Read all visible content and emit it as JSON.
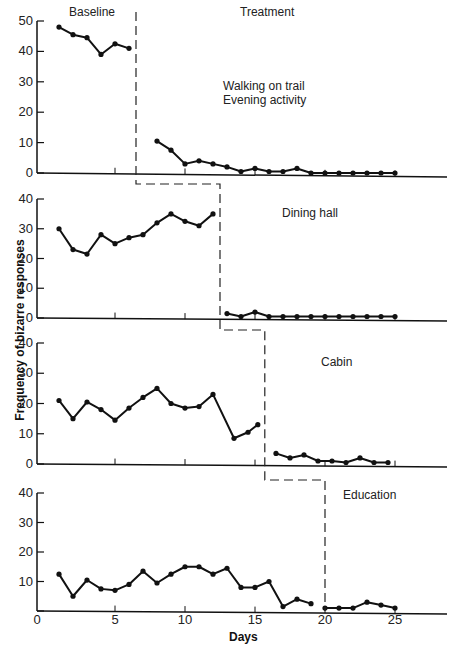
{
  "chart_data": {
    "type": "line",
    "title": "",
    "xlabel": "Days",
    "ylabel": "Frequency of bizarre responses",
    "x_ticks": [
      0,
      5,
      10,
      15,
      20,
      25
    ],
    "xlim": [
      0,
      29
    ],
    "design": "multiple-baseline across settings",
    "phase_labels": {
      "baseline": "Baseline",
      "treatment": "Treatment"
    },
    "panels": [
      {
        "setting": "Walking on trail / Evening activity",
        "label_lines": [
          "Walking on trail",
          "Evening activity"
        ],
        "ylim": [
          0,
          50
        ],
        "y_ticks": [
          0,
          10,
          20,
          30,
          40,
          50
        ],
        "phase_change_after_day": 6.5,
        "baseline": {
          "days": [
            1,
            2,
            3,
            4,
            5,
            6
          ],
          "values": [
            48,
            45.5,
            44.5,
            39,
            42.5,
            41
          ]
        },
        "treatment": {
          "days": [
            8,
            9,
            10,
            11,
            12,
            13,
            14,
            15,
            16,
            17,
            18,
            19,
            20,
            21,
            22,
            23,
            24,
            25
          ],
          "values": [
            10.5,
            7.5,
            3,
            4,
            3,
            2,
            0.5,
            1.5,
            0.5,
            0.5,
            1.5,
            0,
            0,
            0,
            0,
            0,
            0,
            0
          ]
        }
      },
      {
        "setting": "Dining hall",
        "label_lines": [
          "Dining hall"
        ],
        "ylim": [
          0,
          40
        ],
        "y_ticks": [
          0,
          10,
          20,
          30,
          40
        ],
        "phase_change_after_day": 12.5,
        "baseline": {
          "days": [
            1,
            2,
            3,
            4,
            5,
            6,
            7,
            8,
            9,
            10,
            11,
            12
          ],
          "values": [
            30,
            23,
            21.5,
            28,
            25,
            27,
            28,
            32,
            35,
            32.5,
            31,
            35
          ]
        },
        "treatment": {
          "days": [
            13,
            14,
            15,
            16,
            17,
            18,
            19,
            20,
            21,
            22,
            23,
            24,
            25
          ],
          "values": [
            1.5,
            0.5,
            2,
            0.5,
            0.5,
            0.5,
            0.5,
            0.5,
            0.5,
            0.5,
            0.5,
            0.5,
            0.5
          ]
        }
      },
      {
        "setting": "Cabin",
        "label_lines": [
          "Cabin"
        ],
        "ylim": [
          0,
          40
        ],
        "y_ticks": [
          0,
          10,
          20,
          30,
          40
        ],
        "phase_change_after_day": 15.7,
        "baseline": {
          "days": [
            1,
            2,
            3,
            4,
            5,
            6,
            7,
            8,
            9,
            10,
            11,
            12,
            13.5,
            14.5,
            15.2
          ],
          "values": [
            21,
            15,
            20.5,
            18,
            14.5,
            18.5,
            22,
            25,
            20,
            18.5,
            19,
            23,
            8.5,
            10.5,
            13
          ]
        },
        "treatment": {
          "days": [
            16.5,
            17.5,
            18.5,
            19.5,
            20.5,
            21.5,
            22.5,
            23.5,
            24.5
          ],
          "values": [
            3.5,
            2,
            3,
            1,
            1,
            0.5,
            2,
            0.5,
            0.5
          ]
        }
      },
      {
        "setting": "Education",
        "label_lines": [
          "Education"
        ],
        "ylim": [
          0,
          40
        ],
        "y_ticks": [
          0,
          10,
          20,
          30,
          40
        ],
        "phase_change_after_day": 20,
        "baseline": {
          "days": [
            1,
            2,
            3,
            4,
            5,
            6,
            7,
            8,
            9,
            10,
            11,
            12,
            13,
            14,
            15,
            16,
            17,
            18,
            19
          ],
          "values": [
            12.5,
            5,
            10.5,
            7.5,
            7,
            9,
            13.5,
            9.5,
            12.5,
            15,
            15,
            12.5,
            14.5,
            8,
            8,
            10,
            1.5,
            4,
            2.5
          ]
        },
        "treatment": {
          "days": [
            20,
            21,
            22,
            23,
            24,
            25
          ],
          "values": [
            1,
            1,
            1,
            3,
            2,
            1
          ]
        }
      }
    ]
  }
}
